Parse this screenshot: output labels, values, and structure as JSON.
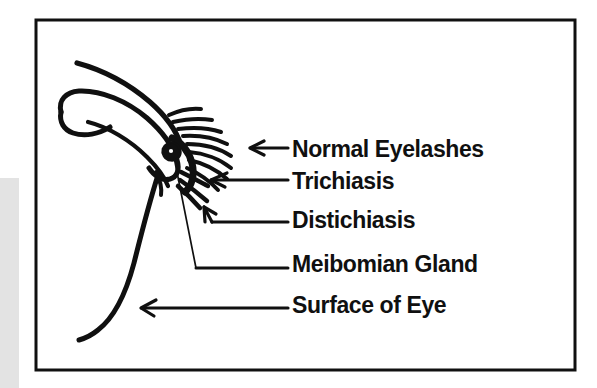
{
  "figure": {
    "kind": "medical-line-diagram",
    "background_color": "#ffffff",
    "ink_color": "#101010",
    "frame": {
      "color": "#101010",
      "border_width_px": 3,
      "x": 36,
      "y": 20,
      "width": 539,
      "height": 350
    },
    "left_gray_band": {
      "color": "#e3e3e3",
      "x": 0,
      "y": 178,
      "width": 19,
      "height": 210
    }
  },
  "labels": [
    {
      "id": "normal-eyelashes",
      "text": "Normal Eyelashes",
      "text_x": 292,
      "text_y": 157,
      "leader": {
        "type": "arrow-horizontal",
        "tip_x": 250,
        "tip_y": 148,
        "tail_x": 288,
        "tail_y": 148
      }
    },
    {
      "id": "trichiasis",
      "text": "Trichiasis",
      "text_x": 292,
      "text_y": 189,
      "leader": {
        "type": "arrow-horizontal",
        "tip_x": 211,
        "tip_y": 180,
        "tail_x": 288,
        "tail_y": 180
      }
    },
    {
      "id": "distichiasis",
      "text": "Distichiasis",
      "text_x": 292,
      "text_y": 228,
      "leader": {
        "type": "arrow-angled",
        "tip_x": 204,
        "tip_y": 207,
        "tail_x": 288,
        "tail_y": 222
      }
    },
    {
      "id": "meibomian-gland",
      "text": "Meibomian Gland",
      "text_x": 292,
      "text_y": 272,
      "leader": {
        "type": "line-no-arrow",
        "tip_x": 174,
        "tip_y": 155,
        "tail_x": 288,
        "tail_y": 268
      }
    },
    {
      "id": "surface-of-eye",
      "text": "Surface of Eye",
      "text_x": 292,
      "text_y": 313,
      "leader": {
        "type": "arrow-horizontal",
        "tip_x": 141,
        "tip_y": 308,
        "tail_x": 288,
        "tail_y": 308
      }
    }
  ],
  "anatomy": {
    "upper_lid_outer_label": "upper-eyelid-outer-contour",
    "upper_lid_inner_label": "upper-eyelid-inner-contour",
    "lid_margin_label": "eyelid-margin",
    "globe_label": "eye-globe-surface",
    "meibomian_gland_label": "meibomian-gland-blob",
    "normal_lash_count": 8,
    "trichiasis_lash_count": 2,
    "distichiasis_lash_count": 1
  }
}
